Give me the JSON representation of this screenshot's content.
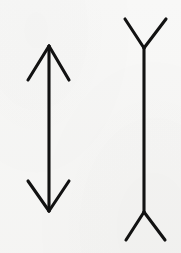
{
  "image": {
    "kind": "line-drawing",
    "subject": "muller-lyer-illusion",
    "width": 181,
    "height": 253,
    "background_color": "#f8f8f7",
    "ink_color": "#121212",
    "stroke_width": 3.1,
    "stroke_linecap": "round"
  },
  "figures": [
    {
      "id": "left-figure",
      "name": "arrow-fins-in",
      "description": "Vertical shaft with arrowheads at both ends pointing outward, fins angled back toward the shaft center",
      "shaft": {
        "x1": 49,
        "y1": 46,
        "x2": 49,
        "y2": 211
      },
      "shaft_length": 165,
      "end_top": {
        "name": "top-arrowhead",
        "apex": {
          "x": 49,
          "y": 46
        },
        "fins": [
          {
            "name": "top-left-fin",
            "x1": 49,
            "y1": 46,
            "x2": 28,
            "y2": 80
          },
          {
            "name": "top-right-fin",
            "x1": 49,
            "y1": 46,
            "x2": 69,
            "y2": 80
          }
        ]
      },
      "end_bottom": {
        "name": "bottom-arrowhead",
        "apex": {
          "x": 49,
          "y": 211
        },
        "fins": [
          {
            "name": "bottom-left-fin",
            "x1": 49,
            "y1": 211,
            "x2": 28,
            "y2": 181
          },
          {
            "name": "bottom-right-fin",
            "x1": 49,
            "y1": 211,
            "x2": 69,
            "y2": 181
          }
        ]
      }
    },
    {
      "id": "right-figure",
      "name": "arrow-fins-out",
      "description": "Vertical shaft with Y-shaped tails at both ends, fins splaying away from the shaft center",
      "shaft": {
        "x1": 144,
        "y1": 48,
        "x2": 144,
        "y2": 212
      },
      "shaft_length": 164,
      "end_top": {
        "name": "top-tail-junction",
        "apex": {
          "x": 144,
          "y": 48
        },
        "fins": [
          {
            "name": "top-left-fin",
            "x1": 144,
            "y1": 48,
            "x2": 125,
            "y2": 19
          },
          {
            "name": "top-right-fin",
            "x1": 144,
            "y1": 48,
            "x2": 166,
            "y2": 19
          }
        ]
      },
      "end_bottom": {
        "name": "bottom-tail-junction",
        "apex": {
          "x": 144,
          "y": 212
        },
        "fins": [
          {
            "name": "bottom-left-fin",
            "x1": 144,
            "y1": 212,
            "x2": 126,
            "y2": 240
          },
          {
            "name": "bottom-right-fin",
            "x1": 144,
            "y1": 212,
            "x2": 165,
            "y2": 240
          }
        ]
      }
    }
  ]
}
